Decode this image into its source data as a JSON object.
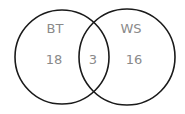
{
  "diagram": {
    "type": "venn",
    "sets": [
      {
        "label": "BT",
        "only_count": "18"
      },
      {
        "label": "WS",
        "only_count": "16"
      }
    ],
    "intersection_count": "3",
    "colors": {
      "stroke": "#1a1a1a",
      "text": "#8a8a8a",
      "background": "#ffffff"
    }
  }
}
